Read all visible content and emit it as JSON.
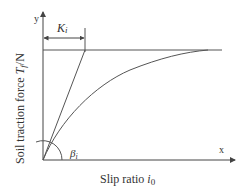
{
  "diagram": {
    "type": "traction-slip curve",
    "axes": {
      "x_label_text": "Slip ratio ",
      "x_label_symbol": "i",
      "x_label_subscript": "0",
      "y_label_text": "Soil traction force ",
      "y_label_symbol": "T",
      "y_label_subscript": "f",
      "y_label_unit": "/N",
      "x_axis_name": "x",
      "y_axis_name": "y"
    },
    "annotations": {
      "stiffness_symbol": "K",
      "stiffness_subscript": "i",
      "angle_symbol": "β",
      "angle_subscript": "i"
    },
    "colors": {
      "line": "#555555",
      "axis": "#444444",
      "text": "#333333"
    }
  }
}
